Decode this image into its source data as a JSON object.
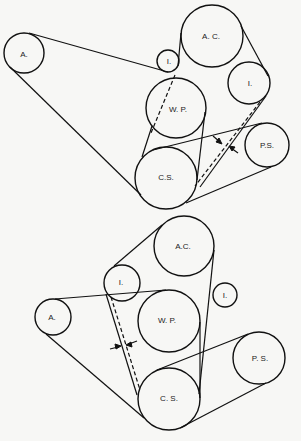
{
  "diagrams": [
    {
      "name": "top-belt-routing",
      "pulleys": [
        {
          "id": "A",
          "label": "A.",
          "cx": 24,
          "cy": 53,
          "r": 20
        },
        {
          "id": "I1",
          "label": "I.",
          "cx": 168,
          "cy": 61,
          "r": 11
        },
        {
          "id": "AC",
          "label": "A. C.",
          "cx": 212,
          "cy": 36,
          "r": 31
        },
        {
          "id": "I2",
          "label": "I.",
          "cx": 249,
          "cy": 83,
          "r": 21
        },
        {
          "id": "WP",
          "label": "W.  P.",
          "cx": 176,
          "cy": 108,
          "r": 30
        },
        {
          "id": "CS",
          "label": "C.S.",
          "cx": 166,
          "cy": 178,
          "r": 31
        },
        {
          "id": "PS",
          "label": "P.S.",
          "cx": 267,
          "cy": 145,
          "r": 22
        }
      ]
    },
    {
      "name": "bottom-belt-routing",
      "pulleys": [
        {
          "id": "AC",
          "label": "A.C.",
          "cx": 184,
          "cy": 246,
          "r": 30
        },
        {
          "id": "I1",
          "label": "I.",
          "cx": 122,
          "cy": 283,
          "r": 18
        },
        {
          "id": "I2",
          "label": "I.",
          "cx": 225,
          "cy": 295,
          "r": 12
        },
        {
          "id": "A",
          "label": "A.",
          "cx": 53,
          "cy": 317,
          "r": 18
        },
        {
          "id": "WP",
          "label": "W. P.",
          "cx": 169,
          "cy": 321,
          "r": 31
        },
        {
          "id": "CS",
          "label": "C. S.",
          "cx": 169,
          "cy": 399,
          "r": 31
        },
        {
          "id": "PS",
          "label": "P. S.",
          "cx": 259,
          "cy": 358,
          "r": 26
        }
      ]
    }
  ],
  "labels": {
    "top": {
      "A": "A.",
      "I1": "I.",
      "AC": "A. C.",
      "I2": "I.",
      "WP": "W.  P.",
      "CS": "C.S.",
      "PS": "P.S."
    },
    "bottom": {
      "AC": "A.C.",
      "I1": "I.",
      "I2": "I.",
      "A": "A.",
      "WP": "W. P.",
      "CS": "C. S.",
      "PS": "P. S."
    }
  },
  "colors": {
    "stroke": "#111111",
    "background": "#f7f7f5"
  }
}
